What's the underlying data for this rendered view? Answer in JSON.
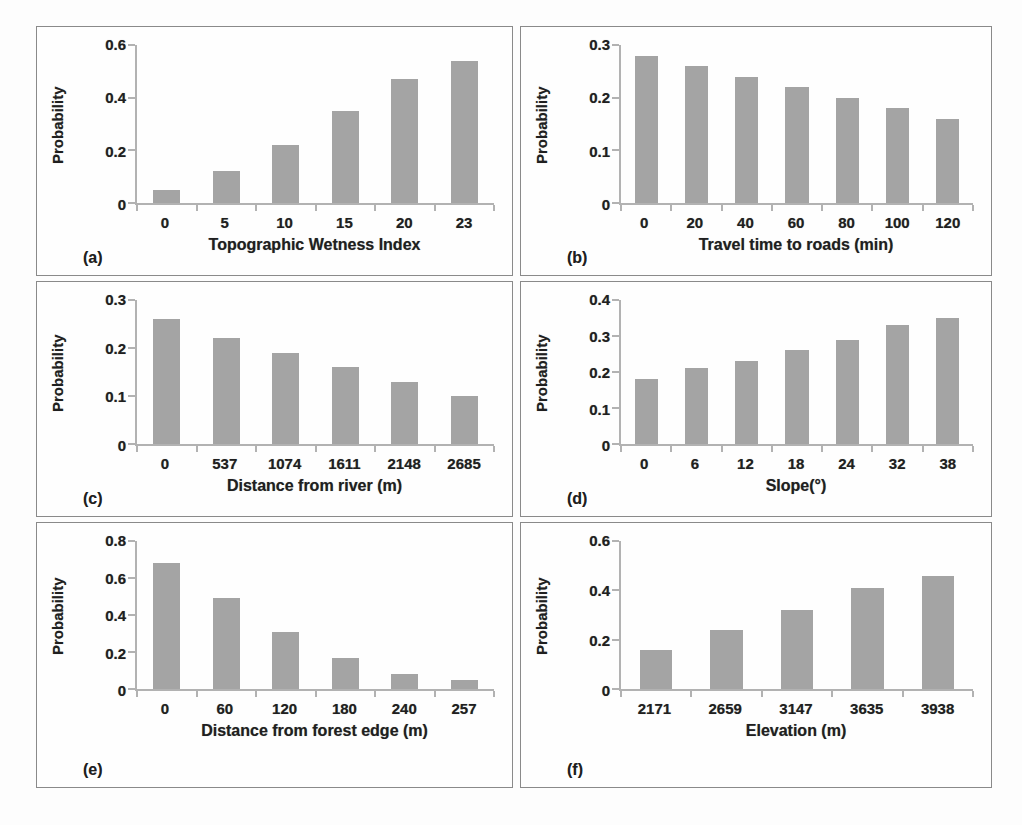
{
  "figure": {
    "background": "#fdfdfd",
    "bar_color": "#a4a4a4",
    "axis_color": "#b2b2b2",
    "text_color": "#1f1f1f",
    "panel_border_color": "#8a8a8a"
  },
  "chart_data": [
    {
      "panel": "a",
      "letter": "(a)",
      "type": "bar",
      "ylabel": "Probability",
      "xlabel": "Topographic Wetness Index",
      "categories": [
        "0",
        "5",
        "10",
        "15",
        "20",
        "23"
      ],
      "values": [
        0.05,
        0.12,
        0.22,
        0.35,
        0.47,
        0.54
      ],
      "ylim": [
        0,
        0.6
      ],
      "yticks": [
        {
          "value": 0,
          "label": "0"
        },
        {
          "value": 0.2,
          "label": "0.2"
        },
        {
          "value": 0.4,
          "label": "0.4"
        },
        {
          "value": 0.6,
          "label": "0.6"
        }
      ],
      "grid": false,
      "legend": "none"
    },
    {
      "panel": "b",
      "letter": "(b)",
      "type": "bar",
      "ylabel": "Probability",
      "xlabel": "Travel time to roads (min)",
      "categories": [
        "0",
        "20",
        "40",
        "60",
        "80",
        "100",
        "120"
      ],
      "values": [
        0.28,
        0.26,
        0.24,
        0.22,
        0.2,
        0.18,
        0.16
      ],
      "ylim": [
        0,
        0.3
      ],
      "yticks": [
        {
          "value": 0,
          "label": "0"
        },
        {
          "value": 0.1,
          "label": "0.1"
        },
        {
          "value": 0.2,
          "label": "0.2"
        },
        {
          "value": 0.3,
          "label": "0.3"
        }
      ],
      "grid": false,
      "legend": "none"
    },
    {
      "panel": "c",
      "letter": "(c)",
      "type": "bar",
      "ylabel": "Probability",
      "xlabel": "Distance from river (m)",
      "categories": [
        "0",
        "537",
        "1074",
        "1611",
        "2148",
        "2685"
      ],
      "values": [
        0.26,
        0.22,
        0.19,
        0.16,
        0.13,
        0.1
      ],
      "ylim": [
        0,
        0.3
      ],
      "yticks": [
        {
          "value": 0,
          "label": "0"
        },
        {
          "value": 0.1,
          "label": "0.1"
        },
        {
          "value": 0.2,
          "label": "0.2"
        },
        {
          "value": 0.3,
          "label": "0.3"
        }
      ],
      "grid": false,
      "legend": "none"
    },
    {
      "panel": "d",
      "letter": "(d)",
      "type": "bar",
      "ylabel": "Probability",
      "xlabel": "Slope(°)",
      "categories": [
        "0",
        "6",
        "12",
        "18",
        "24",
        "32",
        "38"
      ],
      "values": [
        0.18,
        0.21,
        0.23,
        0.26,
        0.29,
        0.33,
        0.35
      ],
      "ylim": [
        0,
        0.4
      ],
      "yticks": [
        {
          "value": 0,
          "label": "0"
        },
        {
          "value": 0.1,
          "label": "0.1"
        },
        {
          "value": 0.2,
          "label": "0.2"
        },
        {
          "value": 0.3,
          "label": "0.3"
        },
        {
          "value": 0.4,
          "label": "0.4"
        }
      ],
      "grid": false,
      "legend": "none"
    },
    {
      "panel": "e",
      "letter": "(e)",
      "type": "bar",
      "ylabel": "Probability",
      "xlabel": "Distance from forest edge (m)",
      "categories": [
        "0",
        "60",
        "120",
        "180",
        "240",
        "257"
      ],
      "values": [
        0.68,
        0.49,
        0.31,
        0.17,
        0.08,
        0.05
      ],
      "ylim": [
        0,
        0.8
      ],
      "yticks": [
        {
          "value": 0,
          "label": "0"
        },
        {
          "value": 0.2,
          "label": "0.2"
        },
        {
          "value": 0.4,
          "label": "0.4"
        },
        {
          "value": 0.6,
          "label": "0.6"
        },
        {
          "value": 0.8,
          "label": "0.8"
        }
      ],
      "grid": false,
      "legend": "none"
    },
    {
      "panel": "f",
      "letter": "(f)",
      "type": "bar",
      "ylabel": "Probability",
      "xlabel": "Elevation (m)",
      "categories": [
        "2171",
        "2659",
        "3147",
        "3635",
        "3938"
      ],
      "values": [
        0.16,
        0.24,
        0.32,
        0.41,
        0.46
      ],
      "ylim": [
        0,
        0.6
      ],
      "yticks": [
        {
          "value": 0,
          "label": "0"
        },
        {
          "value": 0.2,
          "label": "0.2"
        },
        {
          "value": 0.4,
          "label": "0.4"
        },
        {
          "value": 0.6,
          "label": "0.6"
        }
      ],
      "grid": false,
      "legend": "none"
    }
  ]
}
